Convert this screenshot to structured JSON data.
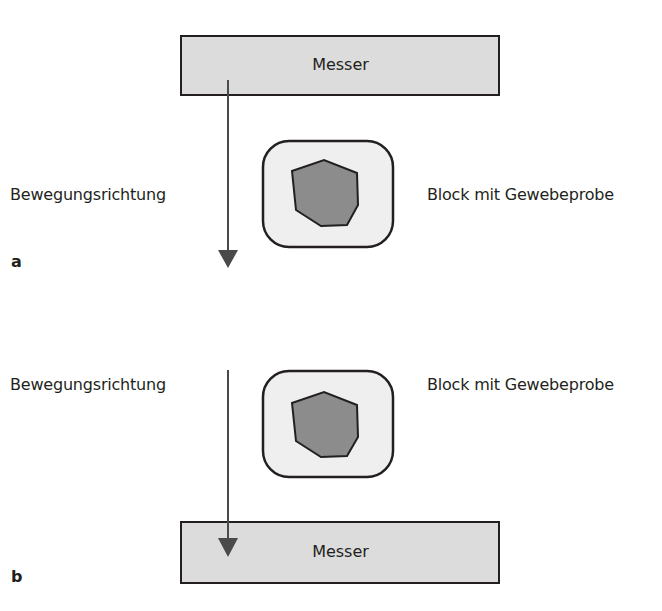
{
  "figure": {
    "panels": [
      {
        "id": "a",
        "panel_label": "a",
        "knife_label": "Messer",
        "direction_label": "Bewegungsrichtung",
        "block_label": "Block mit Gewebeprobe",
        "knife_position": "top"
      },
      {
        "id": "b",
        "panel_label": "b",
        "knife_label": "Messer",
        "direction_label": "Bewegungsrichtung",
        "block_label": "Block mit Gewebeprobe",
        "knife_position": "bottom"
      }
    ],
    "colors": {
      "knife_fill": "#dcdcdc",
      "block_fill": "#efefef",
      "tissue_fill": "#8c8c8c",
      "stroke": "#231f20",
      "arrow": "#4a4a4a"
    }
  }
}
